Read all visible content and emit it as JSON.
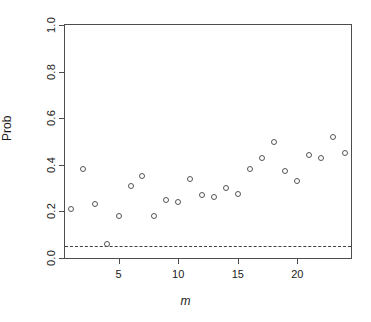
{
  "chart_data": {
    "type": "scatter",
    "title": "",
    "xlabel": "m",
    "ylabel": "Prob",
    "xlim": [
      0.5,
      24.5
    ],
    "ylim": [
      0.0,
      1.0
    ],
    "grid": false,
    "legend": null,
    "xticks": [
      5,
      10,
      15,
      20
    ],
    "xtick_labels": [
      "5",
      "10",
      "15",
      "20"
    ],
    "yticks": [
      0.0,
      0.2,
      0.4,
      0.6,
      0.8,
      1.0
    ],
    "ytick_labels": [
      "0.0",
      "0.2",
      "0.4",
      "0.6",
      "0.8",
      "1.0"
    ],
    "x": [
      1,
      2,
      3,
      4,
      5,
      6,
      7,
      8,
      9,
      10,
      11,
      12,
      13,
      14,
      15,
      16,
      17,
      18,
      19,
      20,
      21,
      22,
      23,
      24
    ],
    "values": [
      0.21,
      0.38,
      0.23,
      0.06,
      0.18,
      0.31,
      0.35,
      0.18,
      0.25,
      0.24,
      0.34,
      0.27,
      0.26,
      0.3,
      0.275,
      0.38,
      0.43,
      0.5,
      0.375,
      0.33,
      0.44,
      0.43,
      0.52,
      0.45
    ],
    "marker": "open-circle",
    "marker_color": "#555555",
    "annotations": [
      {
        "type": "hline",
        "label": "significance-threshold",
        "y": 0.05,
        "style": "dashed",
        "color": "#3f3f3f"
      }
    ]
  },
  "figure": {
    "background_color": "#ffffff",
    "axis_color": "#4d4d4d",
    "text_color": "#1a1a1a"
  }
}
